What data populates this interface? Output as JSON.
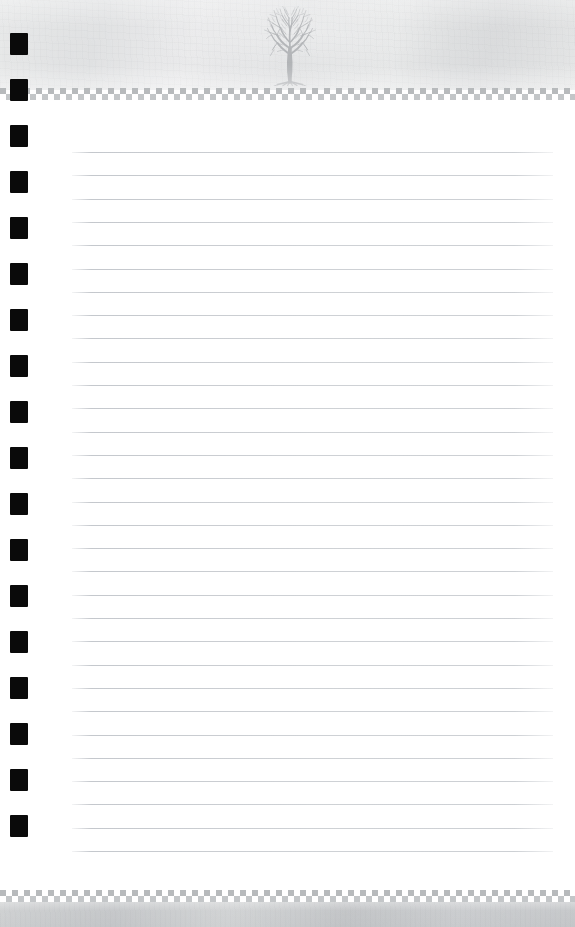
{
  "document": {
    "type": "lined-notebook-stationery",
    "title": "Tree Emblem Lined Paper",
    "page_width": 575,
    "page_height": 927,
    "page_background": "#ffffff"
  },
  "header": {
    "name": "header-band",
    "top": 0,
    "height": 90,
    "background_color": "#e8e9ea",
    "texture": "mottled-paper",
    "emblem": {
      "icon": "tree-icon",
      "description": "bare deciduous tree silhouette with exposed roots",
      "color": "#9a9da0",
      "left": 262,
      "top": 6,
      "width": 56,
      "height": 80
    }
  },
  "checker_border_top": {
    "name": "checker-border-top",
    "top": 88,
    "height": 12,
    "square_size": 6,
    "colors": [
      "#b7babc",
      "#c3c6c8",
      "#ffffff"
    ]
  },
  "checker_border_bottom": {
    "name": "checker-border-bottom",
    "top": 890,
    "height": 12,
    "square_size": 6,
    "colors": [
      "#b7babc",
      "#c3c6c8",
      "#ffffff"
    ]
  },
  "body": {
    "name": "note-body",
    "top": 100,
    "height": 790,
    "background_color": "#ffffff",
    "rules": {
      "count": 31,
      "first_line_y": 152,
      "spacing": 23.3,
      "left": 72,
      "width": 481,
      "color": "#bcc0c5",
      "thickness": 1
    }
  },
  "margin_marks": {
    "name": "margin-squares",
    "count": 18,
    "first_y": 33,
    "spacing": 46,
    "left": 10,
    "width": 18,
    "height": 22,
    "color": "#0a0a0a"
  },
  "footer": {
    "name": "footer-band",
    "top": 902,
    "height": 25,
    "background_color": "#c9cbcd",
    "texture": "mottled-paper"
  }
}
